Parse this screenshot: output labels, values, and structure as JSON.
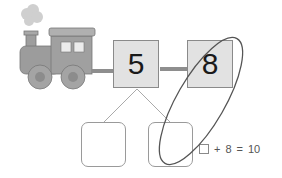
{
  "diagram": {
    "type": "number-bond",
    "train_icon": "steam-locomotive",
    "top_boxes": [
      {
        "value": "5"
      },
      {
        "value": "8"
      }
    ],
    "bottom_boxes": [
      {
        "value": ""
      },
      {
        "value": ""
      }
    ],
    "equation": {
      "blank": "",
      "operator": "+",
      "addend": "8",
      "equals": "=",
      "result": "10"
    },
    "annotation": "ellipse-circling-8-and-right-answer-box",
    "colors": {
      "box_fill": "#e2e2e2",
      "box_border": "#8a8a8a",
      "connector": "#9a9a9a",
      "ellipse_stroke": "#555555",
      "train_body": "#9a9a9a",
      "smoke": "#c8c8c8"
    }
  }
}
